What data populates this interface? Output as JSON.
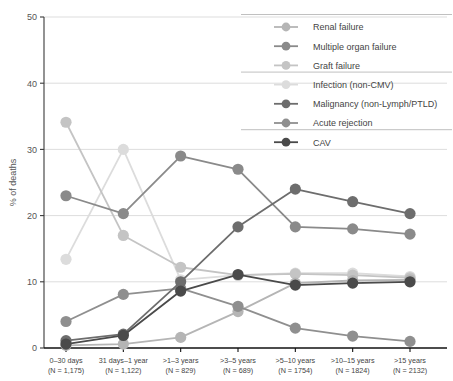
{
  "chart_data": {
    "type": "line",
    "title": "",
    "xlabel": "",
    "ylabel": "% of deaths",
    "ylim": [
      0,
      50
    ],
    "yticks": [
      0,
      10,
      20,
      30,
      40,
      50
    ],
    "grid": true,
    "legend_position": "top-right",
    "categories": [
      "0–30 days",
      "31 days–1 year",
      ">1–3 years",
      ">3–5 years",
      ">5–10 years",
      ">10–15 years",
      ">15 years"
    ],
    "category_sublabels": [
      "(N = 1,175)",
      "(N = 1,122)",
      "(N = 829)",
      "(N = 689)",
      "(N = 1754)",
      "(N = 1824)",
      "(N = 2132)"
    ],
    "series": [
      {
        "name": "Renal failure",
        "color": "#b5b5b5",
        "values": [
          0.4,
          0.6,
          1.6,
          5.5,
          9.8,
          10.2,
          10.3
        ]
      },
      {
        "name": "Multiple organ failure",
        "color": "#8a8a8a",
        "values": [
          23.0,
          20.3,
          29.0,
          27.0,
          18.3,
          18.0,
          17.2
        ]
      },
      {
        "name": "Graft failure",
        "color": "#c4c4c4",
        "values": [
          34.1,
          17.0,
          12.2,
          11.0,
          11.2,
          11.0,
          10.6
        ]
      },
      {
        "name": "Infection (non-CMV)",
        "color": "#dcdcdc",
        "values": [
          13.4,
          30.0,
          10.3,
          11.0,
          11.3,
          11.3,
          10.8
        ]
      },
      {
        "name": "Malignancy (non-Lymph/PTLD)",
        "color": "#6d6d6d",
        "values": [
          1.1,
          2.1,
          10.0,
          18.3,
          24.0,
          22.1,
          20.3
        ]
      },
      {
        "name": "Acute rejection",
        "color": "#8f8f8f",
        "values": [
          4.0,
          8.1,
          9.0,
          6.3,
          3.0,
          1.8,
          1.0
        ]
      },
      {
        "name": "CAV",
        "color": "#4a4a4a",
        "values": [
          0.6,
          1.9,
          8.6,
          11.1,
          9.5,
          9.8,
          10.0
        ]
      }
    ],
    "legend_groups": [
      [
        "Renal failure",
        "Multiple organ failure",
        "Graft failure"
      ],
      [
        "Infection (non-CMV)",
        "Malignancy (non-Lymph/PTLD)",
        "Acute rejection"
      ],
      [
        "CAV"
      ]
    ]
  }
}
